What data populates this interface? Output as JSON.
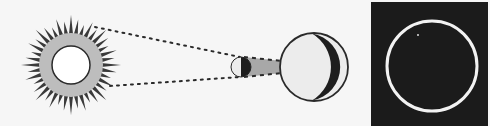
{
  "diagram": {
    "colors": {
      "background": "#f6f6f6",
      "outline": "#2a2a2a",
      "sun_core": "#ffffff",
      "corona": "#bdbdbd",
      "rays": "#3a3a3a",
      "lit_side": "#ececec",
      "dark_side": "#1e1e1e",
      "cone": "#a8a8a8",
      "panel": "#1b1b1b",
      "ring": "#f2f2f2"
    },
    "sun": {
      "cx": 71,
      "cy": 65,
      "core_r": 19,
      "corona_r": 32,
      "ray_outer_r": 50,
      "ray_count": 40
    },
    "moon": {
      "cx": 241,
      "cy": 67,
      "r": 10
    },
    "earth": {
      "cx": 314,
      "cy": 67,
      "r": 34
    },
    "sight_lines": [
      {
        "x1": 95,
        "y1": 27,
        "x2": 240,
        "y2": 57
      },
      {
        "x1": 110,
        "y1": 86,
        "x2": 240,
        "y2": 77
      }
    ],
    "shadow_cone": {
      "x1": 244,
      "top1": 57,
      "bottom1": 77,
      "x2": 282,
      "top2": 61,
      "bottom2": 73
    },
    "inset": {
      "x": 371,
      "y": 2,
      "width": 117,
      "height": 124,
      "ring_cx": 432,
      "ring_cy": 66,
      "ring_r": 45,
      "star_x": 418,
      "star_y": 35
    }
  }
}
